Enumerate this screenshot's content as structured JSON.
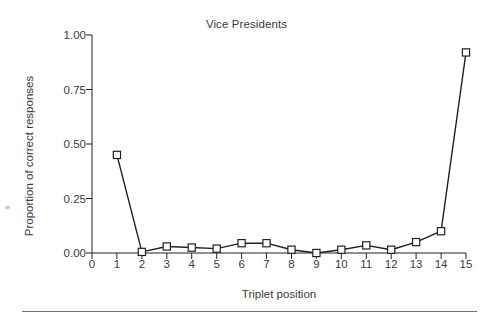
{
  "figure": {
    "title": "Vice Presidents",
    "background_color": "#ffffff",
    "ink_color": "#231f20"
  },
  "axes": {
    "xlabel": "Triplet position",
    "ylabel": "Proportion of correct responses",
    "y_tick_labels": [
      "0.00",
      "0.25",
      "0.50",
      "0.75",
      "1.00"
    ],
    "x_tick_labels": [
      "0",
      "1",
      "2",
      "3",
      "4",
      "5",
      "6",
      "7",
      "8",
      "9",
      "10",
      "11",
      "12",
      "13",
      "14",
      "15"
    ]
  },
  "chart_data": {
    "type": "line",
    "title": "Vice Presidents",
    "subtitle": "",
    "xlabel": "Triplet position",
    "ylabel": "Proportion of correct responses",
    "x": [
      1,
      2,
      3,
      4,
      5,
      6,
      7,
      8,
      9,
      10,
      11,
      12,
      13,
      14,
      15
    ],
    "values": [
      0.45,
      0.005,
      0.03,
      0.025,
      0.02,
      0.045,
      0.045,
      0.015,
      0.0,
      0.015,
      0.035,
      0.015,
      0.05,
      0.1,
      0.92
    ],
    "series": [
      {
        "name": "Vice Presidents",
        "marker": "open-square",
        "line_color": "#231f20",
        "marker_fill": "#ffffff",
        "values": [
          0.45,
          0.005,
          0.03,
          0.025,
          0.02,
          0.045,
          0.045,
          0.015,
          0.0,
          0.015,
          0.035,
          0.015,
          0.05,
          0.1,
          0.92
        ]
      }
    ],
    "xlim": [
      0,
      15
    ],
    "ylim": [
      0.0,
      1.0
    ],
    "y_ticks": [
      0.0,
      0.25,
      0.5,
      0.75,
      1.0
    ],
    "x_ticks": [
      0,
      1,
      2,
      3,
      4,
      5,
      6,
      7,
      8,
      9,
      10,
      11,
      12,
      13,
      14,
      15
    ],
    "grid": false,
    "legend": "none"
  }
}
